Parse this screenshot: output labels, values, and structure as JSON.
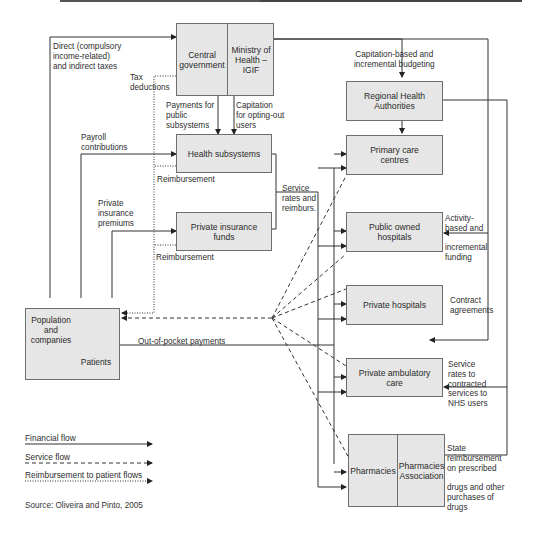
{
  "diagram": {
    "title": "",
    "nodes": {
      "central_government": "Central government",
      "ministry_of_health": "Ministry of Health – IGIF",
      "regional_health_authorities": "Regional Health Authorities",
      "health_subsystems": "Health subsystems",
      "private_insurance_funds": "Private insurance funds",
      "primary_care_centres": "Primary care centres",
      "public_owned_hospitals": "Public owned hospitals",
      "private_hospitals": "Private hospitals",
      "private_ambulatory_care": "Private ambulatory care",
      "pharmacies": "Pharmacies",
      "pharmacies_association": "Pharmacies Association",
      "population_and_companies": "Population and companies",
      "patients": "Patients"
    },
    "edge_labels": {
      "taxes": "Direct (compulsory\nincome-related)\nand indirect taxes",
      "tax_deductions": "Tax\ndeductions",
      "payments_public_subsystems": "Payments for\npublic\nsubsystems",
      "capitation_opting_out": "Capitation\nfor opting-out\nusers",
      "capitation_budgeting": "Capitation-based and\nincremental budgeting",
      "payroll": "Payroll\ncontributions",
      "reimbursement_1": "Reimbursement",
      "private_premiums": "Private\ninsurance\npremiums",
      "reimbursement_2": "Reimbursement",
      "service_rates_reimburs": "Service\nrates and\nreimburs.",
      "activity_based": "Activity-\nbased and\n\nincremental\nfunding",
      "contract_agreements": "Contract\nagreements",
      "out_of_pocket": "Out-of-pocket payments",
      "service_rates_contracted": "Service\nrates to\ncontracted\nservices to\nNHS users",
      "state_reimbursement": "State\nreimbursement\non prescribed\n\ndrugs and other\npurchases of\ndrugs"
    },
    "legend": {
      "financial": "Financial flow",
      "service": "Service flow",
      "reimbursement": "Reimbursement to patient flows"
    },
    "source": "Source: Oliveira and Pinto, 2005"
  },
  "colors": {
    "box_fill": "#e6e6e6",
    "line": "#333333"
  }
}
